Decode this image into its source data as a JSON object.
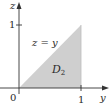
{
  "diagram": {
    "region_label": "D",
    "region_subscript": "2",
    "curve_label": "z = y",
    "axes": {
      "vertical": {
        "label": "z",
        "tick_label": "1"
      },
      "horizontal": {
        "label": "y",
        "tick_label": "1"
      },
      "origin_label": "0"
    },
    "colors": {
      "region_fill": "#cfcfcf",
      "axis": "#333333",
      "text": "#2a2a2a"
    }
  }
}
